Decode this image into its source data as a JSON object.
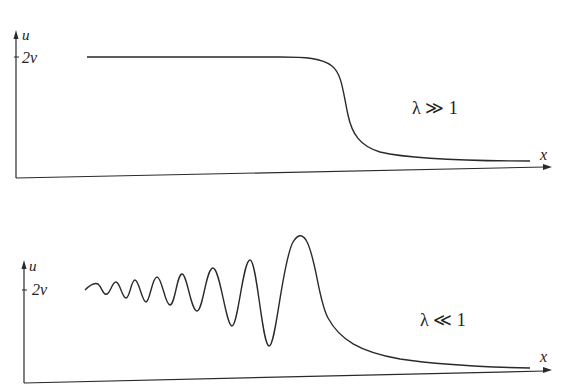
{
  "panels": [
    {
      "id": "top",
      "y_axis_label": "u",
      "x_axis_label": "x",
      "tick_label": "2v",
      "condition_label": "λ ≫ 1",
      "curve_description": "smooth monotonic step (kink/shock-like front) from 2v down to 0"
    },
    {
      "id": "bottom",
      "y_axis_label": "u",
      "x_axis_label": "x",
      "tick_label": "2v",
      "condition_label": "λ ≪ 1",
      "curve_description": "oscillatory dispersive shock: growing oscillations around 2v culminating in a leading soliton, then decaying tail to 0"
    }
  ],
  "colors": {
    "ink": "#2a2a2a",
    "background": "#ffffff"
  }
}
